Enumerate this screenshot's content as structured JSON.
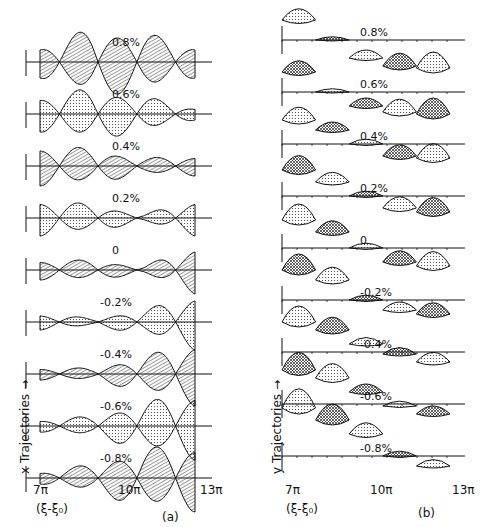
{
  "figure": {
    "panel_a": {
      "id": "(a)",
      "ylabel": "x Trajectories →",
      "xticks": [
        "7π",
        "10π",
        "13π"
      ],
      "xlabel": "(ξ-ξ₀)",
      "traces": [
        {
          "label": "0.8%",
          "amp": [
            16,
            34,
            30,
            16
          ],
          "skew": 0
        },
        {
          "label": "0.6%",
          "amp": [
            18,
            26,
            18,
            6
          ],
          "skew": 0
        },
        {
          "label": "0.4%",
          "amp": [
            20,
            18,
            8,
            10
          ],
          "skew": 0
        },
        {
          "label": "0.2%",
          "amp": [
            18,
            14,
            4,
            18
          ],
          "skew": 0
        },
        {
          "label": "0",
          "amp": [
            10,
            10,
            4,
            24
          ],
          "skew": 0
        },
        {
          "label": "-0.2%",
          "amp": [
            8,
            4,
            12,
            28
          ],
          "skew": 0
        },
        {
          "label": "-0.4%",
          "amp": [
            6,
            6,
            18,
            32
          ],
          "skew": 0
        },
        {
          "label": "-0.6%",
          "amp": [
            6,
            10,
            24,
            34
          ],
          "skew": 0
        },
        {
          "label": "-0.8%",
          "amp": [
            6,
            14,
            30,
            34
          ],
          "skew": 0
        }
      ]
    },
    "panel_b": {
      "id": "(b)",
      "ylabel": "y Trajectories →",
      "xticks": [
        "7π",
        "10π",
        "13π"
      ],
      "xlabel": "(ξ-ξ₀)",
      "traces": [
        {
          "label": "0.8%",
          "amp": [
            14,
            4,
            10,
            16,
            20
          ],
          "offset": [
            20,
            0,
            -18,
            -26,
            -28
          ]
        },
        {
          "label": "0.6%",
          "amp": [
            14,
            4,
            10,
            16,
            20
          ],
          "offset": [
            20,
            0,
            -14,
            -20,
            -22
          ]
        },
        {
          "label": "0.4%",
          "amp": [
            16,
            10,
            6,
            14,
            18
          ],
          "offset": [
            24,
            14,
            0,
            -12,
            -14
          ]
        },
        {
          "label": "0.2%",
          "amp": [
            18,
            12,
            6,
            14,
            18
          ],
          "offset": [
            26,
            14,
            0,
            -12,
            -16
          ]
        },
        {
          "label": "0",
          "amp": [
            20,
            14,
            6,
            14,
            18
          ],
          "offset": [
            28,
            16,
            0,
            -14,
            -18
          ]
        },
        {
          "label": "-0.2%",
          "amp": [
            20,
            16,
            6,
            10,
            14
          ],
          "offset": [
            30,
            20,
            0,
            -10,
            -14
          ]
        },
        {
          "label": "-0.4%",
          "amp": [
            20,
            16,
            8,
            8,
            12
          ],
          "offset": [
            30,
            22,
            8,
            -2,
            -10
          ]
        },
        {
          "label": "-0.6%",
          "amp": [
            22,
            18,
            10,
            6,
            10
          ],
          "offset": [
            34,
            26,
            12,
            -2,
            -10
          ]
        },
        {
          "label": "-0.8%",
          "amp": [
            24,
            20,
            14,
            6,
            8
          ],
          "offset": [
            48,
            36,
            22,
            0,
            -10
          ]
        }
      ]
    }
  },
  "chart_data": [
    {
      "type": "line",
      "title": "(a) x Trajectories",
      "xlabel": "(ξ-ξ₀)",
      "ylabel": "x Trajectories",
      "x_ticks": [
        "7π",
        "10π",
        "13π"
      ],
      "xlim": [
        "7π",
        "13π"
      ],
      "series": [
        {
          "name": "0.8%"
        },
        {
          "name": "0.6%"
        },
        {
          "name": "0.4%"
        },
        {
          "name": "0.2%"
        },
        {
          "name": "0"
        },
        {
          "name": "-0.2%"
        },
        {
          "name": "-0.4%"
        },
        {
          "name": "-0.6%"
        },
        {
          "name": "-0.8%"
        }
      ]
    },
    {
      "type": "line",
      "title": "(b) y Trajectories",
      "xlabel": "(ξ-ξ₀)",
      "ylabel": "y Trajectories",
      "x_ticks": [
        "7π",
        "10π",
        "13π"
      ],
      "xlim": [
        "7π",
        "13π"
      ],
      "series": [
        {
          "name": "0.8%"
        },
        {
          "name": "0.6%"
        },
        {
          "name": "0.4%"
        },
        {
          "name": "0.2%"
        },
        {
          "name": "0"
        },
        {
          "name": "-0.2%"
        },
        {
          "name": "-0.4%"
        },
        {
          "name": "-0.6%"
        },
        {
          "name": "-0.8%"
        }
      ]
    }
  ]
}
